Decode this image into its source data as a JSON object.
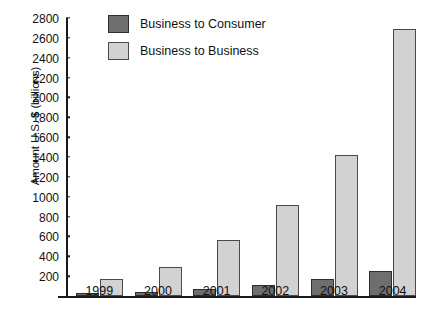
{
  "chart_data": {
    "type": "bar",
    "title": "",
    "xlabel": "",
    "ylabel": "Amount U.S. $ (billions)",
    "ylabel_parts": {
      "prefix": "Amount U.S. ",
      "bold": "$",
      "suffix": " (billions)"
    },
    "categories": [
      "1999",
      "2000",
      "2001",
      "2002",
      "2003",
      "2004"
    ],
    "series": [
      {
        "name": "Business to Consumer",
        "color": "#6e6e6e",
        "values": [
          30,
          40,
          70,
          110,
          170,
          250
        ]
      },
      {
        "name": "Business to Business",
        "color": "#d2d2d2",
        "values": [
          170,
          290,
          560,
          920,
          1420,
          2690
        ]
      }
    ],
    "ylim": [
      0,
      2800
    ],
    "ytick_step": 200,
    "yticks": [
      200,
      400,
      600,
      800,
      1000,
      1200,
      1400,
      1600,
      1800,
      2000,
      2200,
      2400,
      2600,
      2800
    ],
    "grid": false,
    "legend_position": "top-left"
  },
  "legend": {
    "items": [
      {
        "label": "Business to Consumer",
        "swatch": "b2c"
      },
      {
        "label": "Business to Business",
        "swatch": "b2b"
      }
    ]
  },
  "caption": {
    "text": ""
  },
  "colors": {
    "b2c": "#6e6e6e",
    "b2b": "#d2d2d2",
    "axis": "#1a1a1a",
    "background": "#ffffff"
  }
}
